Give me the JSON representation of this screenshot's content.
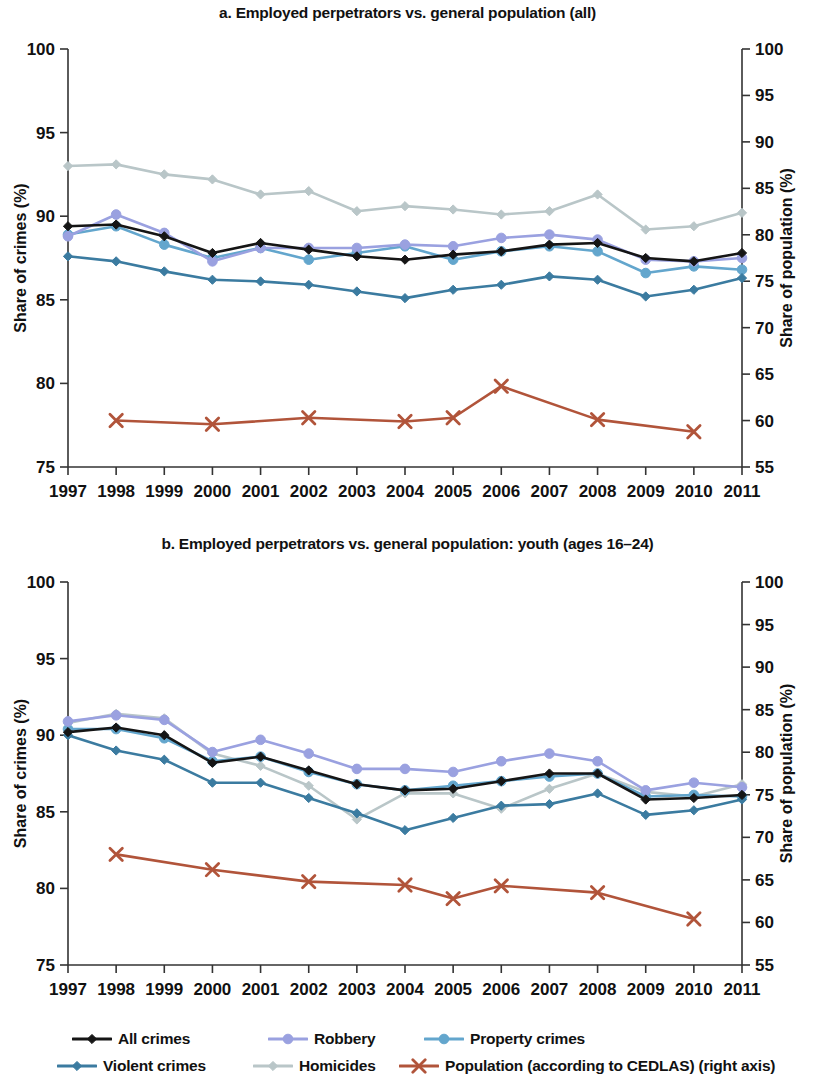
{
  "figure": {
    "width": 815,
    "height": 1083,
    "background": "#ffffff"
  },
  "legend": {
    "rows": [
      [
        {
          "key": "all_crimes",
          "label": "All crimes",
          "color": "#151515",
          "marker": "diamond",
          "x": 72
        },
        {
          "key": "robbery",
          "label": "Robbery",
          "color": "#9aa1e0",
          "marker": "circle",
          "x": 268
        },
        {
          "key": "property_crimes",
          "label": "Property crimes",
          "color": "#63a6cd",
          "marker": "circle",
          "x": 424
        }
      ],
      [
        {
          "key": "violent_crimes",
          "label": "Violent crimes",
          "color": "#3b7ba0",
          "marker": "diamond",
          "x": 57
        },
        {
          "key": "homicides",
          "label": "Homicides",
          "color": "#b9c6c8",
          "marker": "diamond",
          "x": 253
        },
        {
          "key": "population",
          "label": "Population (according to CEDLAS) (right axis)",
          "color": "#b1543a",
          "marker": "cross",
          "x": 399
        }
      ]
    ]
  },
  "series_styles": {
    "all_crimes": {
      "label": "All crimes",
      "color": "#151515",
      "marker": "diamond",
      "axis": "left"
    },
    "violent_crimes": {
      "label": "Violent crimes",
      "color": "#3b7ba0",
      "marker": "diamond",
      "axis": "left"
    },
    "robbery": {
      "label": "Robbery",
      "color": "#9aa1e0",
      "marker": "circle",
      "axis": "left"
    },
    "homicides": {
      "label": "Homicides",
      "color": "#b9c6c8",
      "marker": "diamond",
      "axis": "left"
    },
    "property_crimes": {
      "label": "Property crimes",
      "color": "#63a6cd",
      "marker": "circle",
      "axis": "left"
    },
    "population": {
      "label": "Population (according to CEDLAS) (right axis)",
      "color": "#b1543a",
      "marker": "cross",
      "axis": "right"
    }
  },
  "chart_data": [
    {
      "id": "panel-a",
      "type": "line",
      "title": "a. Employed perpetrators vs. general population (all)",
      "xlabel": "",
      "ylabel": "Share of crimes (%)",
      "y2label": "Share of population (%)",
      "x": [
        1997,
        1998,
        1999,
        2000,
        2001,
        2002,
        2003,
        2004,
        2005,
        2006,
        2007,
        2008,
        2009,
        2010,
        2011
      ],
      "xlim": [
        1997,
        2011
      ],
      "ylim": [
        75,
        100
      ],
      "yticks": [
        75,
        80,
        85,
        90,
        95,
        100
      ],
      "y2lim": [
        55,
        100
      ],
      "y2ticks": [
        55,
        60,
        65,
        70,
        75,
        80,
        85,
        90,
        95,
        100
      ],
      "grid": false,
      "legend_position": "below",
      "series": [
        {
          "name": "All crimes",
          "key": "all_crimes",
          "axis": "left",
          "values": [
            89.4,
            89.5,
            88.8,
            87.8,
            88.4,
            88.0,
            87.6,
            87.4,
            87.7,
            87.9,
            88.3,
            88.4,
            87.5,
            87.3,
            87.8
          ]
        },
        {
          "name": "Violent crimes",
          "key": "violent_crimes",
          "axis": "left",
          "values": [
            87.6,
            87.3,
            86.7,
            86.2,
            86.1,
            85.9,
            85.5,
            85.1,
            85.6,
            85.9,
            86.4,
            86.2,
            85.2,
            85.6,
            86.3
          ]
        },
        {
          "name": "Robbery",
          "key": "robbery",
          "axis": "left",
          "values": [
            88.8,
            90.1,
            89.0,
            87.3,
            88.1,
            88.1,
            88.1,
            88.3,
            88.2,
            88.7,
            88.9,
            88.6,
            87.4,
            87.3,
            87.5
          ]
        },
        {
          "name": "Homicides",
          "key": "homicides",
          "axis": "left",
          "values": [
            93.0,
            93.1,
            92.5,
            92.2,
            91.3,
            91.5,
            90.3,
            90.6,
            90.4,
            90.1,
            90.3,
            91.3,
            89.2,
            89.4,
            90.2
          ]
        },
        {
          "name": "Property crimes",
          "key": "property_crimes",
          "axis": "left",
          "values": [
            88.9,
            89.4,
            88.3,
            87.5,
            88.1,
            87.4,
            87.8,
            88.2,
            87.4,
            87.9,
            88.2,
            87.9,
            86.6,
            87.0,
            86.8
          ]
        },
        {
          "name": "Population (according to CEDLAS) (right axis)",
          "key": "population",
          "axis": "right",
          "values": [
            null,
            60.0,
            null,
            59.6,
            null,
            60.3,
            null,
            59.9,
            60.3,
            63.7,
            null,
            60.1,
            null,
            58.8,
            null
          ]
        }
      ]
    },
    {
      "id": "panel-b",
      "type": "line",
      "title": "b. Employed perpetrators vs. general population: youth (ages 16–24)",
      "xlabel": "",
      "ylabel": "Share of crimes (%)",
      "y2label": "Share of population (%)",
      "x": [
        1997,
        1998,
        1999,
        2000,
        2001,
        2002,
        2003,
        2004,
        2005,
        2006,
        2007,
        2008,
        2009,
        2010,
        2011
      ],
      "xlim": [
        1997,
        2011
      ],
      "ylim": [
        75,
        100
      ],
      "yticks": [
        75,
        80,
        85,
        90,
        95,
        100
      ],
      "y2lim": [
        55,
        100
      ],
      "y2ticks": [
        55,
        60,
        65,
        70,
        75,
        80,
        85,
        90,
        95,
        100
      ],
      "grid": false,
      "legend_position": "below",
      "series": [
        {
          "name": "All crimes",
          "key": "all_crimes",
          "axis": "left",
          "values": [
            90.2,
            90.5,
            90.0,
            88.2,
            88.6,
            87.7,
            86.8,
            86.4,
            86.5,
            87.0,
            87.5,
            87.5,
            85.8,
            85.9,
            86.1
          ]
        },
        {
          "name": "Violent crimes",
          "key": "violent_crimes",
          "axis": "left",
          "values": [
            90.0,
            89.0,
            88.4,
            86.9,
            86.9,
            85.9,
            84.9,
            83.8,
            84.6,
            85.4,
            85.5,
            86.2,
            84.8,
            85.1,
            85.8
          ]
        },
        {
          "name": "Robbery",
          "key": "robbery",
          "axis": "left",
          "values": [
            90.9,
            91.3,
            91.0,
            88.9,
            89.7,
            88.8,
            87.8,
            87.8,
            87.6,
            88.3,
            88.8,
            88.3,
            86.4,
            86.9,
            86.6
          ]
        },
        {
          "name": "Homicides",
          "key": "homicides",
          "axis": "left",
          "values": [
            90.8,
            91.4,
            91.1,
            88.8,
            88.0,
            86.7,
            84.5,
            86.2,
            86.2,
            85.2,
            86.5,
            87.5,
            86.3,
            86.0,
            86.8
          ]
        },
        {
          "name": "Property crimes",
          "key": "property_crimes",
          "axis": "left",
          "values": [
            90.4,
            90.4,
            89.8,
            88.3,
            88.6,
            87.6,
            86.8,
            86.4,
            86.7,
            87.0,
            87.3,
            87.5,
            86.0,
            86.1,
            86.0
          ]
        },
        {
          "name": "Population (according to CEDLAS) (right axis)",
          "key": "population",
          "axis": "right",
          "values": [
            null,
            68.0,
            null,
            66.2,
            null,
            64.8,
            null,
            64.4,
            62.8,
            64.3,
            null,
            63.5,
            null,
            60.4,
            null
          ]
        }
      ]
    }
  ]
}
